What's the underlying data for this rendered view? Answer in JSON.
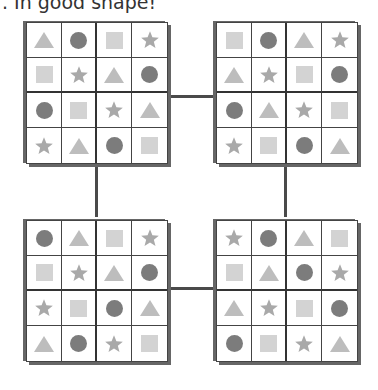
{
  "title": ". In good shape!",
  "colors": {
    "circle": "#7c7c7c",
    "square": "#d3d3d3",
    "triangle": "#bdbdbd",
    "star": "#a9a9a9",
    "grid_border": "#444444",
    "connector": "#4a4a4a"
  },
  "grids": [
    {
      "position": "top-left",
      "rows": [
        [
          "triangle",
          "circle",
          "square",
          "star"
        ],
        [
          "square",
          "star",
          "triangle",
          "circle"
        ],
        [
          "circle",
          "square",
          "star",
          "triangle"
        ],
        [
          "star",
          "triangle",
          "circle",
          "square"
        ]
      ]
    },
    {
      "position": "top-right",
      "rows": [
        [
          "square",
          "circle",
          "triangle",
          "star"
        ],
        [
          "triangle",
          "star",
          "square",
          "circle"
        ],
        [
          "circle",
          "triangle",
          "star",
          "square"
        ],
        [
          "star",
          "square",
          "circle",
          "triangle"
        ]
      ]
    },
    {
      "position": "bottom-left",
      "rows": [
        [
          "circle",
          "triangle",
          "square",
          "star"
        ],
        [
          "square",
          "star",
          "triangle",
          "circle"
        ],
        [
          "star",
          "square",
          "circle",
          "triangle"
        ],
        [
          "triangle",
          "circle",
          "star",
          "square"
        ]
      ]
    },
    {
      "position": "bottom-right",
      "rows": [
        [
          "star",
          "circle",
          "triangle",
          "square"
        ],
        [
          "square",
          "triangle",
          "circle",
          "star"
        ],
        [
          "triangle",
          "star",
          "square",
          "circle"
        ],
        [
          "circle",
          "square",
          "star",
          "triangle"
        ]
      ]
    }
  ]
}
